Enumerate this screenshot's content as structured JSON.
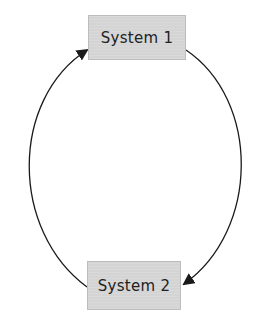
{
  "diagram": {
    "type": "cycle",
    "nodes": [
      {
        "id": "s1",
        "label": "System 1"
      },
      {
        "id": "s2",
        "label": "System 2"
      }
    ],
    "edges": [
      {
        "from": "s1",
        "to": "s2",
        "side": "right"
      },
      {
        "from": "s2",
        "to": "s1",
        "side": "left"
      }
    ],
    "colors": {
      "node_fill": "#d4d4d4",
      "edge": "#1a1a1a",
      "background": "#ffffff"
    }
  }
}
